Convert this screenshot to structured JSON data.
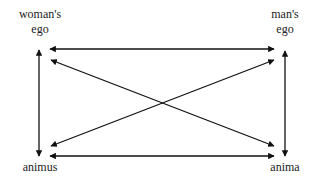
{
  "nodes": {
    "womans_ego": {
      "line1": "woman's",
      "line2": "ego"
    },
    "mans_ego": {
      "line1": "man's",
      "line2": "ego"
    },
    "animus": {
      "label": "animus"
    },
    "anima": {
      "label": "anima"
    }
  },
  "edges": [
    {
      "from": "woman's ego",
      "to": "man's ego",
      "type": "bidirectional"
    },
    {
      "from": "animus",
      "to": "anima",
      "type": "bidirectional"
    },
    {
      "from": "woman's ego",
      "to": "animus",
      "type": "bidirectional"
    },
    {
      "from": "man's ego",
      "to": "anima",
      "type": "bidirectional"
    },
    {
      "from": "woman's ego",
      "to": "anima",
      "type": "bidirectional"
    },
    {
      "from": "animus",
      "to": "man's ego",
      "type": "bidirectional"
    }
  ],
  "colors": {
    "stroke": "#111111",
    "text": "#222222",
    "background": "#ffffff"
  }
}
